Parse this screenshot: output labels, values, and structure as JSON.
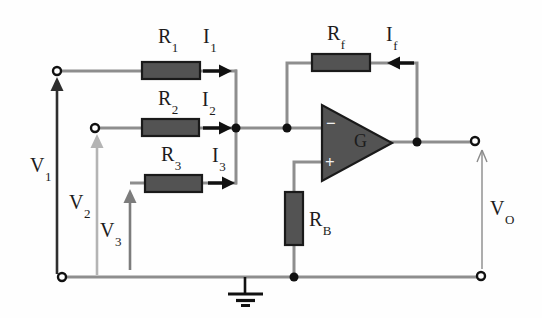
{
  "colors": {
    "background": "#fefefe",
    "wire": "#8e8e8e",
    "component_fill": "#535353",
    "component_border": "#1a1a1a",
    "node": "#111111",
    "label": "#1c1c1c",
    "current_arrow": "#111111",
    "v1_arrow": "#2e2e2e",
    "v2_arrow": "#b4b4b4",
    "v3_arrow": "#7c7c7c",
    "vo_arrow": "#8a8a8a",
    "opamp_mark": "#f0f0f0"
  },
  "labels": {
    "r1": {
      "base": "R",
      "sub": "1"
    },
    "i1": {
      "base": "I",
      "sub": "1"
    },
    "r2": {
      "base": "R",
      "sub": "2"
    },
    "i2": {
      "base": "I",
      "sub": "2"
    },
    "r3": {
      "base": "R",
      "sub": "3"
    },
    "i3": {
      "base": "I",
      "sub": "3"
    },
    "rf": {
      "base": "R",
      "sub": "f"
    },
    "if": {
      "base": "I",
      "sub": "f"
    },
    "rb": {
      "base": "R",
      "sub": "B"
    },
    "v1": {
      "base": "V",
      "sub": "1"
    },
    "v2": {
      "base": "V",
      "sub": "2"
    },
    "v3": {
      "base": "V",
      "sub": "3"
    },
    "vo": {
      "base": "V",
      "sub": "O"
    }
  },
  "opamp": {
    "gain": "G",
    "inverting_mark": "−",
    "noninverting_mark": "+"
  }
}
